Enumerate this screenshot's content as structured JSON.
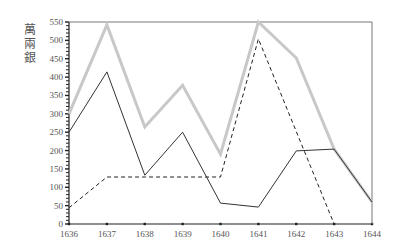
{
  "chart_data": {
    "type": "line",
    "title": "",
    "xlabel": "",
    "ylabel": "萬兩銀",
    "x": [
      1636,
      1637,
      1638,
      1639,
      1640,
      1641,
      1642,
      1643,
      1644
    ],
    "xlim": [
      1636,
      1644
    ],
    "ylim": [
      0,
      550
    ],
    "yticks": [
      0,
      50,
      100,
      150,
      200,
      250,
      300,
      350,
      400,
      450,
      500,
      550
    ],
    "xticks": [
      1636,
      1637,
      1638,
      1639,
      1640,
      1641,
      1642,
      1643,
      1644
    ],
    "grid": false,
    "legend": null,
    "series": [
      {
        "name": "total",
        "style": "thick-gray",
        "color": "#c8c8c8",
        "values": [
          300,
          542,
          264,
          378,
          190,
          550,
          452,
          204,
          60
        ]
      },
      {
        "name": "series-solid",
        "style": "thin-solid",
        "color": "#333333",
        "values": [
          250,
          414,
          133,
          250,
          57,
          46,
          199,
          204,
          60
        ]
      },
      {
        "name": "series-dashed",
        "style": "dashed",
        "color": "#222222",
        "values": [
          44,
          128,
          128,
          128,
          128,
          504,
          null,
          0,
          null
        ]
      }
    ]
  }
}
